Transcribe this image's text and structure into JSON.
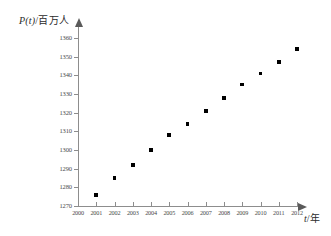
{
  "chart_data": {
    "type": "scatter",
    "title": "",
    "xlabel": "t/年",
    "ylabel": "P(t)/百万人",
    "ylabel_italic_part": "P(t)",
    "ylabel_rest": "/百万人",
    "xlabel_italic_part": "t",
    "xlabel_rest": "/年",
    "x": [
      2001,
      2002,
      2003,
      2004,
      2005,
      2006,
      2007,
      2008,
      2009,
      2010,
      2011,
      2012
    ],
    "values": [
      1276,
      1285,
      1292,
      1300,
      1308,
      1314,
      1321,
      1328,
      1335,
      1341,
      1347,
      1354
    ],
    "categories": [
      "2001",
      "2002",
      "2003",
      "2004",
      "2005",
      "2006",
      "2007",
      "2008",
      "2009",
      "2010",
      "2011",
      "2012"
    ],
    "xlim": [
      2000,
      2012
    ],
    "ylim": [
      1270,
      1360
    ],
    "xticks": [
      2000,
      2001,
      2002,
      2003,
      2004,
      2005,
      2006,
      2007,
      2008,
      2009,
      2010,
      2011,
      2012
    ],
    "xtick_labels": [
      "2000",
      "2001",
      "2002",
      "2003",
      "2004",
      "2005",
      "2006",
      "2007",
      "2008",
      "2009",
      "2010",
      "2011",
      "2012"
    ],
    "yticks": [
      1270,
      1280,
      1290,
      1300,
      1310,
      1320,
      1330,
      1340,
      1350,
      1360
    ],
    "ytick_labels": [
      "1270",
      "1280",
      "1290",
      "1300",
      "1310",
      "1320",
      "1330",
      "1340",
      "1350",
      "1360"
    ],
    "grid": false,
    "legend": null,
    "marker": "square",
    "marker_color": "#000000",
    "axis_color": "#8d8d8d"
  }
}
